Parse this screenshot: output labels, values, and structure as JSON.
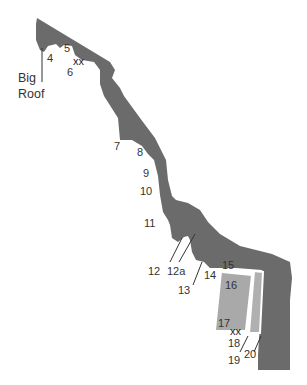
{
  "diagram": {
    "type": "climbing-topo",
    "colors": {
      "rock": "#6b6b6b",
      "slab": "#a9a9a9",
      "background": "#ffffff",
      "text": "#333333"
    },
    "feature_label": {
      "line1": "Big",
      "line2": "Roof"
    },
    "route_labels": {
      "r4": "4",
      "r5": "5",
      "r6": "6",
      "r7": "7",
      "r8": "8",
      "r9": "9",
      "r10": "10",
      "r11": "11",
      "r12": "12",
      "r12a": "12a",
      "r13": "13",
      "r14": "14",
      "r15": "15",
      "r16": "16",
      "r17": "17",
      "r18": "18",
      "r19": "19",
      "r20": "20"
    },
    "anchor_marks": {
      "top": "xx",
      "bottom": "xx"
    }
  }
}
